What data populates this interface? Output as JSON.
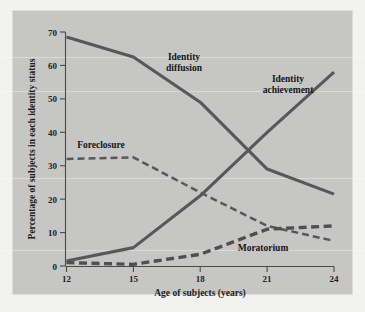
{
  "figure": {
    "background_color": "#f2f2f0",
    "panel_color": "#c6c6c4",
    "ink_color": "#58585a"
  },
  "chart_data": {
    "type": "line",
    "title": "",
    "xlabel": "Age of subjects (years)",
    "ylabel": "Percentage of subjects in each identity status",
    "x": [
      12,
      15,
      18,
      21,
      24
    ],
    "xlim": [
      12,
      24
    ],
    "ylim": [
      0,
      70
    ],
    "xticks": [
      12,
      15,
      18,
      21,
      24
    ],
    "xtick_labels": [
      "12",
      "15",
      "18",
      "21",
      "24"
    ],
    "yticks": [
      0,
      10,
      20,
      30,
      40,
      50,
      60,
      70
    ],
    "ytick_labels": [
      "0",
      "10",
      "20",
      "30",
      "40",
      "50",
      "60",
      "70"
    ],
    "grid": false,
    "legend": "inline-annotations",
    "series": [
      {
        "name": "Identity diffusion",
        "style": "solid",
        "color": "#58585a",
        "values": [
          68.5,
          62.5,
          49.0,
          29.0,
          21.5
        ]
      },
      {
        "name": "Identity achievement",
        "style": "solid",
        "color": "#58585a",
        "values": [
          1.5,
          5.5,
          21.0,
          40.0,
          58.0
        ]
      },
      {
        "name": "Foreclosure",
        "style": "dashed-thin",
        "color": "#58585a",
        "values": [
          32.0,
          32.5,
          22.0,
          12.0,
          7.5
        ]
      },
      {
        "name": "Moratorium",
        "style": "dashed-thick",
        "color": "#4f4f51",
        "values": [
          1.0,
          0.5,
          3.5,
          11.0,
          12.0
        ]
      }
    ],
    "annotations": [
      {
        "text": "Identity",
        "series": "Identity diffusion",
        "line": 1
      },
      {
        "text": "diffusion",
        "series": "Identity diffusion",
        "line": 2
      },
      {
        "text": "Identity",
        "series": "Identity achievement",
        "line": 1
      },
      {
        "text": "achievement",
        "series": "Identity achievement",
        "line": 2
      },
      {
        "text": "Foreclosure",
        "series": "Foreclosure",
        "line": 1
      },
      {
        "text": "Moratorium",
        "series": "Moratorium",
        "line": 1
      }
    ]
  }
}
